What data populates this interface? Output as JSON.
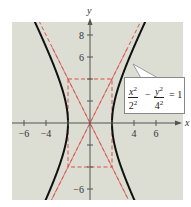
{
  "chart_data": {
    "type": "line",
    "title": "",
    "xlabel": "x",
    "ylabel": "y",
    "xlim": [
      -7,
      8.5
    ],
    "ylim": [
      -7,
      9
    ],
    "x_ticks": [
      -6,
      -4,
      4,
      6
    ],
    "y_ticks": [
      8,
      6,
      -6
    ],
    "x_tick_labels": [
      "−6",
      "−4",
      "4",
      "6"
    ],
    "y_tick_labels": [
      "8",
      "6",
      "−6"
    ],
    "grid": false,
    "background": "#dcddd3",
    "series": [
      {
        "name": "hyperbola",
        "equation": "x^2/2^2 - y^2/4^2 = 1",
        "a": 2,
        "b": 4,
        "color": "#111111",
        "style": "solid"
      },
      {
        "name": "asymptote_1",
        "equation": "y = 2x",
        "color": "#d9534f",
        "style": "dashed"
      },
      {
        "name": "asymptote_2",
        "equation": "y = -2x",
        "color": "#d9534f",
        "style": "dashed"
      },
      {
        "name": "central_rectangle",
        "corners": [
          [
            -2,
            4
          ],
          [
            2,
            4
          ],
          [
            2,
            -4
          ],
          [
            -2,
            -4
          ]
        ],
        "color": "#d9534f",
        "style": "dashed"
      }
    ],
    "annotations": [
      {
        "text": "x²/2² − y²/4² = 1",
        "points_to": [
          3.9,
          5.8
        ]
      }
    ]
  },
  "labels": {
    "x_axis": "x",
    "y_axis": "y",
    "ticks_x": {
      "m6": "−6",
      "m4": "−4",
      "p4": "4",
      "p6": "6"
    },
    "ticks_y": {
      "p8": "8",
      "p6": "6",
      "m6": "−6"
    }
  },
  "equation": {
    "num1": "x",
    "den1": "2",
    "num2": "y",
    "den2": "4",
    "exp": "2",
    "minus": "−",
    "equals": "= 1"
  }
}
